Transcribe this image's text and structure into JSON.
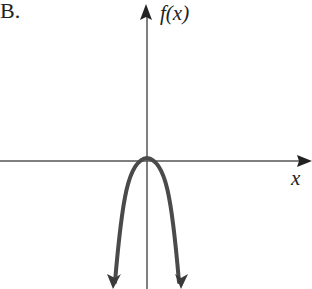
{
  "figure": {
    "option_label": "B.",
    "y_axis_label": "f(x)",
    "x_axis_label": "x"
  },
  "graph": {
    "description": "Downward-opening parabola-like curve with vertex at the origin, both ends pointing downward with arrows",
    "curve_color": "#4a4a4a",
    "axis_color": "#555555"
  }
}
